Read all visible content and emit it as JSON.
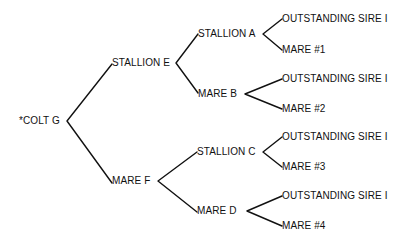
{
  "diagram": {
    "type": "pedigree-tree",
    "line_color": "#111111",
    "background": "#ffffff",
    "root": {
      "label": "*COLT G",
      "sire": {
        "label": "STALLION E",
        "sire": {
          "label": "STALLION A",
          "sire": {
            "label": "OUTSTANDING SIRE I"
          },
          "dam": {
            "label": "MARE #1"
          }
        },
        "dam": {
          "label": "MARE B",
          "sire": {
            "label": "OUTSTANDING SIRE I"
          },
          "dam": {
            "label": "MARE #2"
          }
        }
      },
      "dam": {
        "label": "MARE F",
        "sire": {
          "label": "STALLION C",
          "sire": {
            "label": "OUTSTANDING SIRE I"
          },
          "dam": {
            "label": "MARE #3"
          }
        },
        "dam": {
          "label": "MARE D",
          "sire": {
            "label": "OUTSTANDING SIRE I"
          },
          "dam": {
            "label": "MARE #4"
          }
        }
      }
    }
  }
}
